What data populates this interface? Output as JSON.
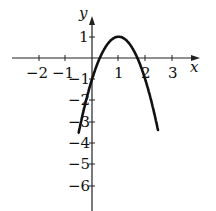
{
  "chart_data": {
    "type": "line",
    "title": "",
    "xlabel": "x",
    "ylabel": "y",
    "function": "y = -2(x-1)^2 + 1",
    "xlim": [
      -2.5,
      3.7
    ],
    "ylim": [
      -7,
      1.6
    ],
    "x_ticks": [
      -2,
      -1,
      1,
      2,
      3
    ],
    "y_ticks": [
      1,
      -1,
      -2,
      -3,
      -4,
      -5,
      -6
    ],
    "x_tick_labels": [
      "−2",
      "−1",
      "1",
      "2",
      "3"
    ],
    "y_tick_labels": [
      "1",
      "−1",
      "−2",
      "−3",
      "−4",
      "−5",
      "−6"
    ],
    "series": [
      {
        "name": "parabola",
        "x": [
          -0.35,
          0,
          0.29,
          0.5,
          1,
          1.5,
          1.71,
          2,
          2.35
        ],
        "y": [
          -2.65,
          -1,
          0,
          0.5,
          1,
          0.5,
          0,
          -1,
          -2.65
        ]
      }
    ],
    "vertex": [
      1,
      1
    ],
    "grid": false,
    "legend": null
  },
  "labels": {
    "x_axis": "x",
    "y_axis": "y",
    "xt": [
      "−2",
      "−1",
      "1",
      "2",
      "3"
    ],
    "yt": [
      "1",
      "−1",
      "−2",
      "−3",
      "−4",
      "−5",
      "−6"
    ]
  }
}
